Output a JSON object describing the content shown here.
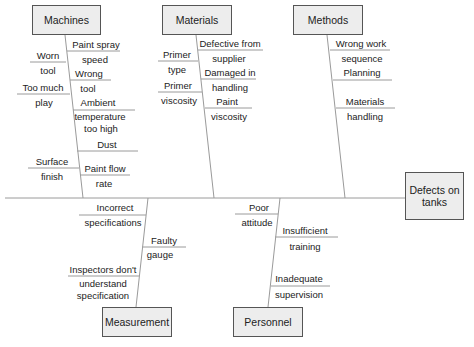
{
  "diagram": {
    "type": "cause-and-effect (fishbone)",
    "effect": "Defects on tanks",
    "categories": {
      "machines": {
        "label": "Machines",
        "causes": [
          "Paint spray speed",
          "Worn tool",
          "Wrong tool",
          "Too much play",
          "Ambient temperature too high",
          "Dust",
          "Surface finish",
          "Paint flow rate"
        ],
        "text": {
          "c1a": "Paint spray",
          "c1b": "speed",
          "c2a": "Worn",
          "c2b": "tool",
          "c3a": "Wrong",
          "c3b": "tool",
          "c4a": "Too much",
          "c4b": "play",
          "c5a": "Ambient",
          "c5b": "temperature",
          "c5c": "too high",
          "c6a": "Dust",
          "c7a": "Surface",
          "c7b": "finish",
          "c8a": "Paint flow",
          "c8b": "rate"
        }
      },
      "materials": {
        "label": "Materials",
        "causes": [
          "Defective from supplier",
          "Primer type",
          "Damaged in handling",
          "Primer viscosity",
          "Paint viscosity"
        ],
        "text": {
          "c1a": "Defective from",
          "c1b": "supplier",
          "c2a": "Primer",
          "c2b": "type",
          "c3a": "Damaged in",
          "c3b": "handling",
          "c4a": "Primer",
          "c4b": "viscosity",
          "c5a": "Paint",
          "c5b": "viscosity"
        }
      },
      "methods": {
        "label": "Methods",
        "causes": [
          "Wrong work sequence",
          "Planning",
          "Materials handling"
        ],
        "text": {
          "c1a": "Wrong work",
          "c1b": "sequence",
          "c2a": "Planning",
          "c3a": "Materials",
          "c3b": "handling"
        }
      },
      "measurement": {
        "label": "Measurement",
        "causes": [
          "Incorrect specifications",
          "Faulty gauge",
          "Inspectors don't understand specification"
        ],
        "text": {
          "c1a": "Incorrect",
          "c1b": "specifications",
          "c2a": "Faulty",
          "c2b": "gauge",
          "c3a": "Inspectors don't",
          "c3b": "understand",
          "c3c": "specification"
        }
      },
      "personnel": {
        "label": "Personnel",
        "causes": [
          "Poor attitude",
          "Insufficient training",
          "Inadequate supervision"
        ],
        "text": {
          "c1a": "Poor",
          "c1b": "attitude",
          "c2a": "Insufficient",
          "c2b": "training",
          "c3a": "Inadequate",
          "c3b": "supervision"
        }
      }
    },
    "colors": {
      "line": "#9a9a9a",
      "box_fill": "#ededed",
      "box_border": "#555555"
    }
  }
}
